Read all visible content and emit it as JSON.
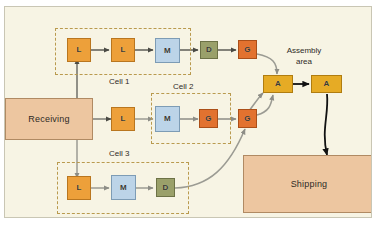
{
  "figure": {
    "canvas_bg": "#f7f4e4",
    "canvas_border": "#c9c6b4"
  },
  "palette": {
    "lathe": "#eda03a",
    "mill": "#bcd4e8",
    "drill": "#9aa06a",
    "grind": "#e2722f",
    "assembly": "#e6ab25",
    "department": "#edc6a0",
    "cell_outline": "#b99a4e",
    "arrow_gray": "#8d8d86",
    "arrow_dark": "#4a4a44",
    "arrow_black": "#111111"
  },
  "departments": {
    "receiving": {
      "label": "Receiving"
    },
    "shipping": {
      "label": "Shipping"
    }
  },
  "labels": {
    "cell1": "Cell 1",
    "cell2": "Cell 2",
    "cell3": "Cell 3",
    "assembly_line1": "Assembly",
    "assembly_line2": "area"
  },
  "machines": {
    "cell1": [
      {
        "code": "L",
        "type": "lathe"
      },
      {
        "code": "L",
        "type": "lathe"
      },
      {
        "code": "M",
        "type": "mill"
      }
    ],
    "cell1_downstream": [
      {
        "code": "D",
        "type": "drill"
      },
      {
        "code": "G",
        "type": "grind"
      }
    ],
    "cell2": [
      {
        "code": "L",
        "type": "lathe"
      },
      {
        "code": "M",
        "type": "mill"
      },
      {
        "code": "G",
        "type": "grind"
      }
    ],
    "cell2_downstream": [
      {
        "code": "G",
        "type": "grind"
      }
    ],
    "cell3": [
      {
        "code": "L",
        "type": "lathe"
      },
      {
        "code": "M",
        "type": "mill"
      },
      {
        "code": "D",
        "type": "drill"
      }
    ],
    "assembly": [
      {
        "code": "A",
        "type": "assembly"
      },
      {
        "code": "A",
        "type": "assembly"
      }
    ]
  }
}
